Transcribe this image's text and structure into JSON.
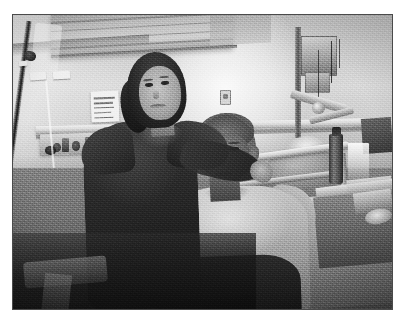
{
  "page": {
    "background_color": "#ffffff",
    "width": 407,
    "height": 325
  },
  "photograph": {
    "kind": "photograph",
    "color_mode": "black-and-white",
    "border_color": "#4a4a4a",
    "frame": {
      "left": 12,
      "top": 14,
      "width": 381,
      "height": 296
    },
    "caption": "",
    "scene": "hospital room",
    "description": "Black-and-white photograph of a smiling woman standing with her arm around a young person with a shaved head who is sitting up on a hospital bed.",
    "subjects": [
      {
        "name": "standing-woman",
        "label": "Woman standing with arm around seated young person",
        "details": "Dark shoulder-length hair tied back, smiling, wearing a dark knitted top"
      },
      {
        "name": "seated-young-person",
        "label": "Young person seated on hospital bed",
        "details": "Shaved head, light short-sleeved t-shirt, dark blanket over lap"
      }
    ],
    "scene_elements": [
      {
        "name": "iv-pole",
        "label": "IV drip stand"
      },
      {
        "name": "iv-bag",
        "label": "IV fluid bag"
      },
      {
        "name": "wall-notice",
        "label": "Printed notice taped to window"
      },
      {
        "name": "wall-notice-secondary",
        "label": "Second printed notice"
      },
      {
        "name": "window-blind",
        "label": "Window blind"
      },
      {
        "name": "wall-outlet",
        "label": "Wall socket plate"
      },
      {
        "name": "medical-equipment-panel",
        "label": "Wall-mounted medical equipment"
      },
      {
        "name": "equipment-cables",
        "label": "Hanging cables"
      },
      {
        "name": "articulated-arm",
        "label": "Articulated equipment arm"
      },
      {
        "name": "bed-rail",
        "label": "Hospital bed side rail"
      },
      {
        "name": "pillow",
        "label": "Pillow"
      },
      {
        "name": "bedside-table",
        "label": "Bedside table"
      },
      {
        "name": "water-bottle",
        "label": "Dark drinking bottle"
      },
      {
        "name": "plastic-cup",
        "label": "Plastic cup"
      },
      {
        "name": "bed-blanket",
        "label": "Dark bed blanket"
      }
    ]
  }
}
